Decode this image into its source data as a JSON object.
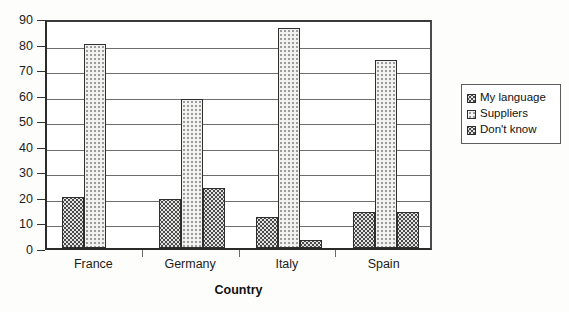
{
  "chart_data": {
    "type": "bar",
    "title": "",
    "subtitle": "",
    "xlabel": "Country",
    "ylabel": "",
    "categories": [
      "France",
      "Germany",
      "Italy",
      "Spain"
    ],
    "series": [
      {
        "name": "My language",
        "values": [
          20,
          19,
          12,
          14
        ],
        "pattern": "dark-dotted"
      },
      {
        "name": "Suppliers",
        "values": [
          80,
          58.5,
          86,
          73.5
        ],
        "pattern": "light-dotted"
      },
      {
        "name": "Don't know",
        "values": [
          0,
          23.5,
          3,
          14
        ],
        "pattern": "dark-dotted"
      }
    ],
    "ylim": [
      0,
      90
    ],
    "ytick_step": 10,
    "yticks": [
      0,
      10,
      20,
      30,
      40,
      50,
      60,
      70,
      80,
      90
    ],
    "ytick_labels": [
      "0",
      "10",
      "20",
      "30",
      "40",
      "50",
      "60",
      "70",
      "80",
      "90"
    ],
    "grid": true,
    "grid_axis": "y",
    "legend_position": "right",
    "legend_entries": [
      "My language",
      "Suppliers",
      "Don't know"
    ],
    "annotations": []
  },
  "colors": {
    "axis": "#2b2b2b",
    "grid": "#6d6d6d",
    "bar_outline": "#2e2e2e",
    "dark_fill": "#e3e3e3",
    "dark_dot": "#4a4a4a",
    "light_fill": "#f2f2f0",
    "light_dot": "#9c9c9c",
    "background": "#fdfdfb",
    "plot_background": "#ffffff",
    "text": "#1c1c1c"
  },
  "axis": {
    "x_title": "Country"
  },
  "legend": {
    "items": [
      {
        "label": "My language",
        "pattern": "dark-dotted"
      },
      {
        "label": "Suppliers",
        "pattern": "light-dotted"
      },
      {
        "label": "Don't know",
        "pattern": "dark-dotted"
      }
    ]
  }
}
